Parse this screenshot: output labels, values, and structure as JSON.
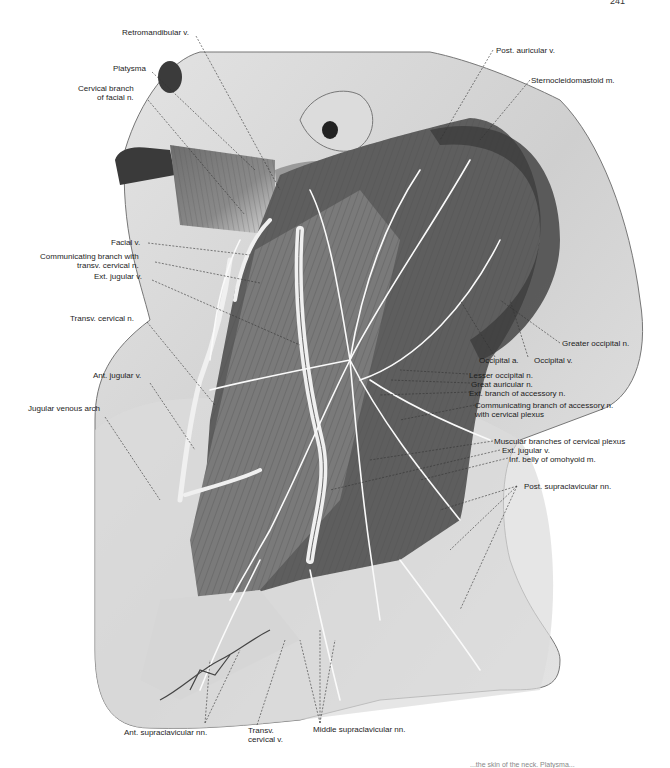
{
  "page": {
    "number": "241",
    "caption_fragment": "...the skin of the neck. Platysma..."
  },
  "figure": {
    "labels_left": [
      {
        "id": "retromandibular-v",
        "text": "Retromandibular v."
      },
      {
        "id": "platysma",
        "text": "Platysma"
      },
      {
        "id": "cervical-branch-facial-n",
        "text": "Cervical branch\nof facial n."
      },
      {
        "id": "facial-v",
        "text": "Facial v."
      },
      {
        "id": "communicating-branch-transv",
        "text": "Communicating branch with\ntransv. cervical n."
      },
      {
        "id": "ext-jugular-v-left",
        "text": "Ext. jugular v."
      },
      {
        "id": "transv-cervical-n",
        "text": "Transv. cervical n."
      },
      {
        "id": "ant-jugular-v",
        "text": "Ant. jugular v."
      },
      {
        "id": "jugular-venous-arch",
        "text": "Jugular venous arch"
      }
    ],
    "labels_right": [
      {
        "id": "post-auricular-v",
        "text": "Post. auricular v."
      },
      {
        "id": "sternocleidomastoid-m",
        "text": "Sternocleidomastoid m."
      },
      {
        "id": "greater-occipital-n",
        "text": "Greater occipital n."
      },
      {
        "id": "occipital-a",
        "text": "Occipital a."
      },
      {
        "id": "occipital-v",
        "text": "Occipital v."
      },
      {
        "id": "lesser-occipital-n",
        "text": "Lesser occipital n."
      },
      {
        "id": "great-auricular-n",
        "text": "Great auricular n."
      },
      {
        "id": "ext-branch-accessory-n",
        "text": "Ext. branch of accessory n."
      },
      {
        "id": "communicating-branch-accessory",
        "text": "Communicating branch of accessory n.\nwith cervical plexus"
      },
      {
        "id": "muscular-branches",
        "text": "Muscular branches of cervical plexus"
      },
      {
        "id": "ext-jugular-v-right",
        "text": "Ext. jugular v."
      },
      {
        "id": "inf-belly-omohyoid",
        "text": "Inf. belly of omohyoid m."
      },
      {
        "id": "post-supraclavicular-nn",
        "text": "Post. supraclavicular nn."
      }
    ],
    "labels_bottom": [
      {
        "id": "ant-supraclavicular-nn",
        "text": "Ant. supraclavicular nn."
      },
      {
        "id": "transv-cervical-v",
        "text": "Transv.\ncervical v."
      },
      {
        "id": "middle-supraclavicular-nn",
        "text": "Middle supraclavicular nn."
      }
    ]
  }
}
